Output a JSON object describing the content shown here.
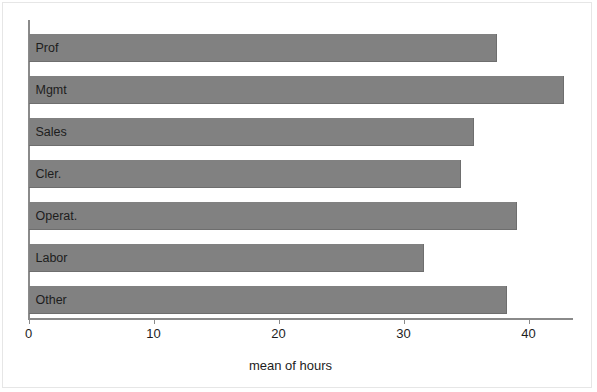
{
  "chart_data": {
    "type": "bar",
    "orientation": "horizontal",
    "title": "",
    "subtitle": "",
    "xlabel": "mean of hours",
    "ylabel": "",
    "categories": [
      "Prof",
      "Mgmt",
      "Sales",
      "Cler.",
      "Operat.",
      "Labor",
      "Other"
    ],
    "values": [
      37.5,
      42.8,
      35.6,
      34.6,
      39.1,
      31.6,
      38.3
    ],
    "xlim": [
      0,
      43.5
    ],
    "xticks": [
      0,
      10,
      20,
      30,
      40
    ],
    "xtick_labels": [
      "0",
      "10",
      "20",
      "30",
      "40"
    ],
    "yticks": [],
    "ytick_labels": [],
    "grid": false,
    "legend": null,
    "bar_color": "#818181",
    "axis_color": "#8a8a8a",
    "text_color": "#1d1d1d",
    "background_color": "#ffffff",
    "bar_labels_inside": true
  }
}
